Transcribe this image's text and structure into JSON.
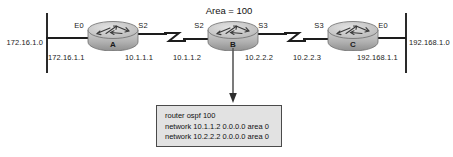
{
  "diagram": {
    "title_annotation": "Area = 100",
    "segments": [
      {
        "name": "left-ethernet-segment",
        "label": "172.16.1.0"
      },
      {
        "name": "right-ethernet-segment",
        "label": "192.168.1.0"
      }
    ],
    "routers": [
      {
        "name": "A",
        "left_interface": "E0",
        "right_interface": "S2",
        "left_ip": "172.16.1.1",
        "right_ip": "10.1.1.1"
      },
      {
        "name": "B",
        "left_interface": "S2",
        "right_interface": "S3",
        "left_ip": "10.1.1.2",
        "right_ip": "10.2.2.2"
      },
      {
        "name": "C",
        "left_interface": "S3",
        "right_interface": "E0",
        "left_ip": "10.2.2.3",
        "right_ip": "192.168.1.1"
      }
    ],
    "config_box": {
      "lines": [
        "router ospf 100",
        "network 10.1.1.2 0.0.0.0 area 0",
        "network 10.2.2.2 0.0.0.0 area 0"
      ]
    },
    "colors": {
      "background": "#ffffff",
      "line": "#1d1d1d",
      "router_body": "#b9b9b9",
      "config_fill": "#e2e2e2",
      "config_border": "#4a4a4a",
      "text": "#111111"
    }
  }
}
